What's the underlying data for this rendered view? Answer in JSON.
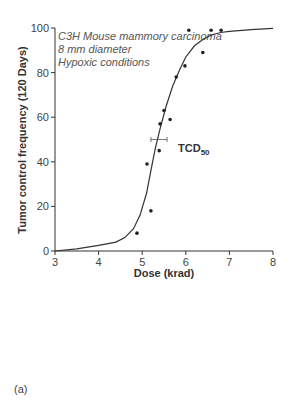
{
  "chart_data": {
    "type": "scatter",
    "title": "",
    "annotation_lines": [
      "C3H Mouse mammory carcinoma",
      "8 mm diameter",
      "Hypoxic conditions"
    ],
    "xlabel": "Dose (krad)",
    "ylabel": "Tumor control frequency (120 Days)",
    "xlim": [
      3,
      8
    ],
    "ylim": [
      0,
      100
    ],
    "x_ticks": [
      3,
      4,
      5,
      6,
      7,
      8
    ],
    "y_ticks": [
      0,
      20,
      40,
      60,
      80,
      100
    ],
    "grid": false,
    "legend": null,
    "series": [
      {
        "name": "Observed",
        "type": "scatter",
        "x": [
          4.88,
          5.11,
          5.2,
          5.39,
          5.41,
          5.5,
          5.64,
          5.78,
          5.98,
          6.07,
          6.39,
          6.58,
          6.81
        ],
        "y": [
          8,
          39,
          18,
          45,
          57,
          63,
          59,
          78,
          83,
          99,
          89,
          99,
          99
        ]
      },
      {
        "name": "Fitted dose-response curve",
        "type": "line",
        "x": [
          3.0,
          3.5,
          4.0,
          4.4,
          4.6,
          4.8,
          4.95,
          5.1,
          5.2,
          5.3,
          5.4,
          5.55,
          5.7,
          5.85,
          6.0,
          6.2,
          6.4,
          6.6,
          6.8,
          7.0,
          7.5,
          8.0
        ],
        "y": [
          0,
          1,
          2.5,
          4,
          6,
          10,
          16,
          26,
          36,
          46,
          54,
          65,
          74,
          81,
          87,
          92,
          95,
          97,
          98,
          98.5,
          99.3,
          99.8
        ]
      }
    ],
    "tcd50": {
      "label": "TCD",
      "subscript": "50",
      "x": 5.38,
      "y": 50,
      "ci_low": 5.2,
      "ci_high": 5.57
    }
  },
  "panel_label": "(a)"
}
